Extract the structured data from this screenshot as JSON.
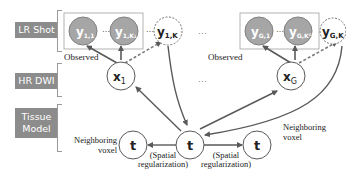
{
  "rows": {
    "lr_shot": "LR Shot",
    "hr_dwi": "HR DWI",
    "tissue_model_line1": "Tissue",
    "tissue_model_line2": "Model"
  },
  "nodes": {
    "y11": {
      "main": "y",
      "sub": "1,1"
    },
    "y1k1": {
      "main": "y",
      "sub": "1,K₁"
    },
    "y1k": {
      "main": "y",
      "sub": "1,K"
    },
    "yg1": {
      "main": "y",
      "sub": "G,1"
    },
    "ygkg": {
      "main": "y",
      "sub": "G,Kᴳ"
    },
    "ygk": {
      "main": "y",
      "sub": "G,K"
    },
    "x1": {
      "main": "x",
      "sub": "1"
    },
    "xg": {
      "main": "x",
      "sub": "G"
    },
    "t_center": "t",
    "t_left": "t",
    "t_right": "t"
  },
  "labels": {
    "observed_left": "Observed",
    "observed_right": "Observed",
    "neighboring_left_line1": "Neighboring",
    "neighboring_left_line2": "voxel",
    "neighboring_right_line1": "Neighboring",
    "neighboring_right_line2": "voxel",
    "spatial_left_line1": "(Spatial",
    "spatial_left_line2": "regularization)",
    "spatial_right_line1": "(Spatial",
    "spatial_right_line2": "regularization)",
    "ellipsis": "⋯",
    "ellipsis_dots": "…"
  },
  "colors": {
    "label_bg": "#8c8c8c",
    "observed_fill": "#a6a6a6",
    "edge": "#595959",
    "box": "#a0a0a0"
  }
}
